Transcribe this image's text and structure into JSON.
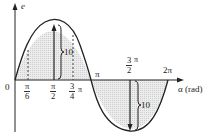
{
  "diagram": {
    "type": "sine-waveform",
    "y_axis_label": "e",
    "x_axis_label": "α (rad)",
    "origin_label": "0",
    "amplitude_label_positive": "10",
    "amplitude_label_negative": "10",
    "tick_labels": {
      "pi_over_6": {
        "num": "π",
        "den": "6"
      },
      "pi_over_2": {
        "num": "π",
        "den": "2"
      },
      "three_quarter_pi": {
        "num": "3",
        "den": "4",
        "suffix": "π"
      },
      "pi": "π",
      "three_halves_pi": {
        "num": "3",
        "den": "2",
        "suffix": "π"
      },
      "two_pi": "2π"
    },
    "colors": {
      "curve": "#222222",
      "fill": "#e4e4e4"
    }
  }
}
